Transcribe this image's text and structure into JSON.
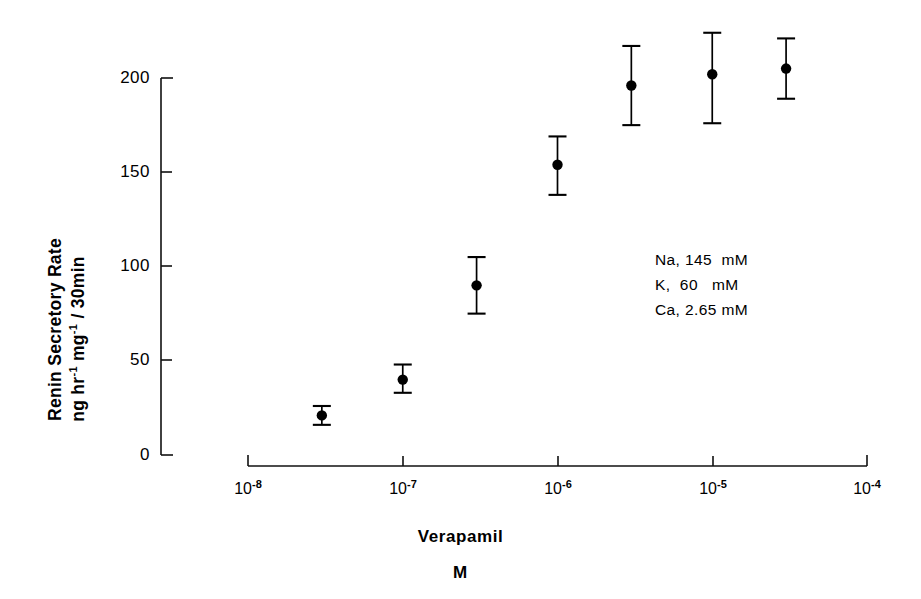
{
  "chart_data": {
    "type": "scatter",
    "title": "",
    "xlabel": "Verapamil",
    "xlabel_unit": "M",
    "ylabel_line1": "Renin Secretory Rate",
    "ylabel_line2_prefix": "ng hr",
    "ylabel_line2_sup1": "-1",
    "ylabel_line2_mid": " mg",
    "ylabel_line2_sup2": "-1",
    "ylabel_line2_suffix": " / 30min",
    "ylabel_full": "Renin Secretory Rate ng hr-1 mg-1 / 30min",
    "xscale": "log",
    "xlim": [
      1e-08,
      0.0001
    ],
    "ylim": [
      0,
      200
    ],
    "grid": false,
    "legend_position": "inside-right",
    "x_tick_labels": [
      "10-8",
      "10-7",
      "10-6",
      "10-5",
      "10-4"
    ],
    "x_tick_mantissa": [
      "10",
      "10",
      "10",
      "10",
      "10"
    ],
    "x_tick_exponents": [
      "-8",
      "-7",
      "-6",
      "-5",
      "-4"
    ],
    "x_tick_values": [
      1e-08,
      1e-07,
      1e-06,
      1e-05,
      0.0001
    ],
    "y_tick_labels": [
      "0",
      "50",
      "100",
      "150",
      "200"
    ],
    "y_tick_values": [
      0,
      50,
      100,
      150,
      200
    ],
    "series": [
      {
        "name": "Renin secretory rate vs verapamil",
        "marker": "filled-circle",
        "x": [
          3e-08,
          1e-07,
          3e-07,
          1e-06,
          3e-06,
          1e-05,
          3e-05
        ],
        "values": [
          21,
          40,
          90,
          154,
          196,
          202,
          205
        ],
        "err_low": [
          5,
          7,
          15,
          16,
          21,
          26,
          16
        ],
        "err_high": [
          5,
          8,
          15,
          15,
          21,
          22,
          16
        ],
        "y_low": [
          16,
          33,
          75,
          138,
          175,
          176,
          189
        ],
        "y_high": [
          26,
          48,
          105,
          169,
          217,
          224,
          221
        ]
      }
    ],
    "annotations": [
      "Na, 145  mM",
      "K,  60   mM",
      "Ca, 2.65 mM"
    ]
  },
  "conditions": {
    "sodium": {
      "ion": "Na,",
      "value": "145",
      "unit": "mM"
    },
    "potassium": {
      "ion": "K,",
      "value": "60",
      "unit": "mM"
    },
    "calcium": {
      "ion": "Ca,",
      "value": "2.65",
      "unit": "mM"
    },
    "line1": "Na, 145  mM",
    "line2": "K,  60   mM",
    "line3": "Ca, 2.65 mM"
  },
  "axes": {
    "y_title_line1": "Renin Secretory Rate",
    "x_title": "Verapamil",
    "x_unit": "M"
  },
  "colors": {
    "ink": "#111111",
    "background": "#ffffff",
    "marker": "#000000"
  }
}
